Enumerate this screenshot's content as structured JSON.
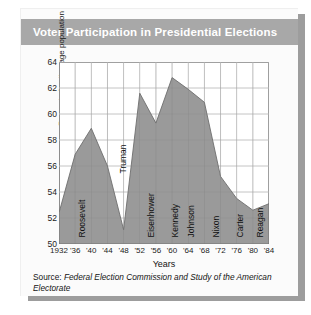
{
  "title": "Voter Participation in Presidential Elections",
  "source": {
    "label": "Source:",
    "body": "Federal Election Commission and Study of the American Electorate"
  },
  "chart_data": {
    "type": "area",
    "title": "Voter Participation in Presidential Elections",
    "xlabel": "Years",
    "ylabel": "Percent of voting age population",
    "categories": [
      "1932",
      "'36",
      "'40",
      "'44",
      "'48",
      "'52",
      "'56",
      "'60",
      "'64",
      "'68",
      "'72",
      "'76",
      "'80",
      "'84"
    ],
    "x": [
      1932,
      1936,
      1940,
      1944,
      1948,
      1952,
      1956,
      1960,
      1964,
      1968,
      1972,
      1976,
      1980,
      1984
    ],
    "values": [
      52.4,
      56.9,
      58.9,
      56.0,
      51.1,
      61.6,
      59.3,
      62.8,
      61.9,
      60.9,
      55.2,
      53.5,
      52.6,
      53.1
    ],
    "ylim": [
      50,
      64
    ],
    "yticks": [
      50,
      52,
      54,
      56,
      58,
      60,
      62,
      64
    ],
    "ytick_labels": [
      "50",
      "52",
      "54",
      "56",
      "58",
      "60",
      "62",
      "64"
    ],
    "xlim": [
      1932,
      1984
    ],
    "grid": true,
    "legend": "none",
    "fill_color": "#9a9a9a",
    "line_color": "#6e6e6e",
    "annotations": [
      {
        "label": "Roosevelt",
        "x": 1938
      },
      {
        "label": "Truman",
        "x": 1948
      },
      {
        "label": "Eisenhower",
        "x": 1955
      },
      {
        "label": "Kennedy",
        "x": 1961
      },
      {
        "label": "Johnson",
        "x": 1965
      },
      {
        "label": "Carter",
        "x": 1977
      },
      {
        "label": "Nixon",
        "x": 1971
      },
      {
        "label": "Reagan",
        "x": 1982
      }
    ]
  },
  "colors": {
    "banner": "#a8a8a8",
    "banner_text": "#ffffff",
    "card": "#fbfbfb",
    "shadow": "#9d9d9d",
    "axis": "#8d8d8d",
    "grid": "#c9c9c9"
  }
}
